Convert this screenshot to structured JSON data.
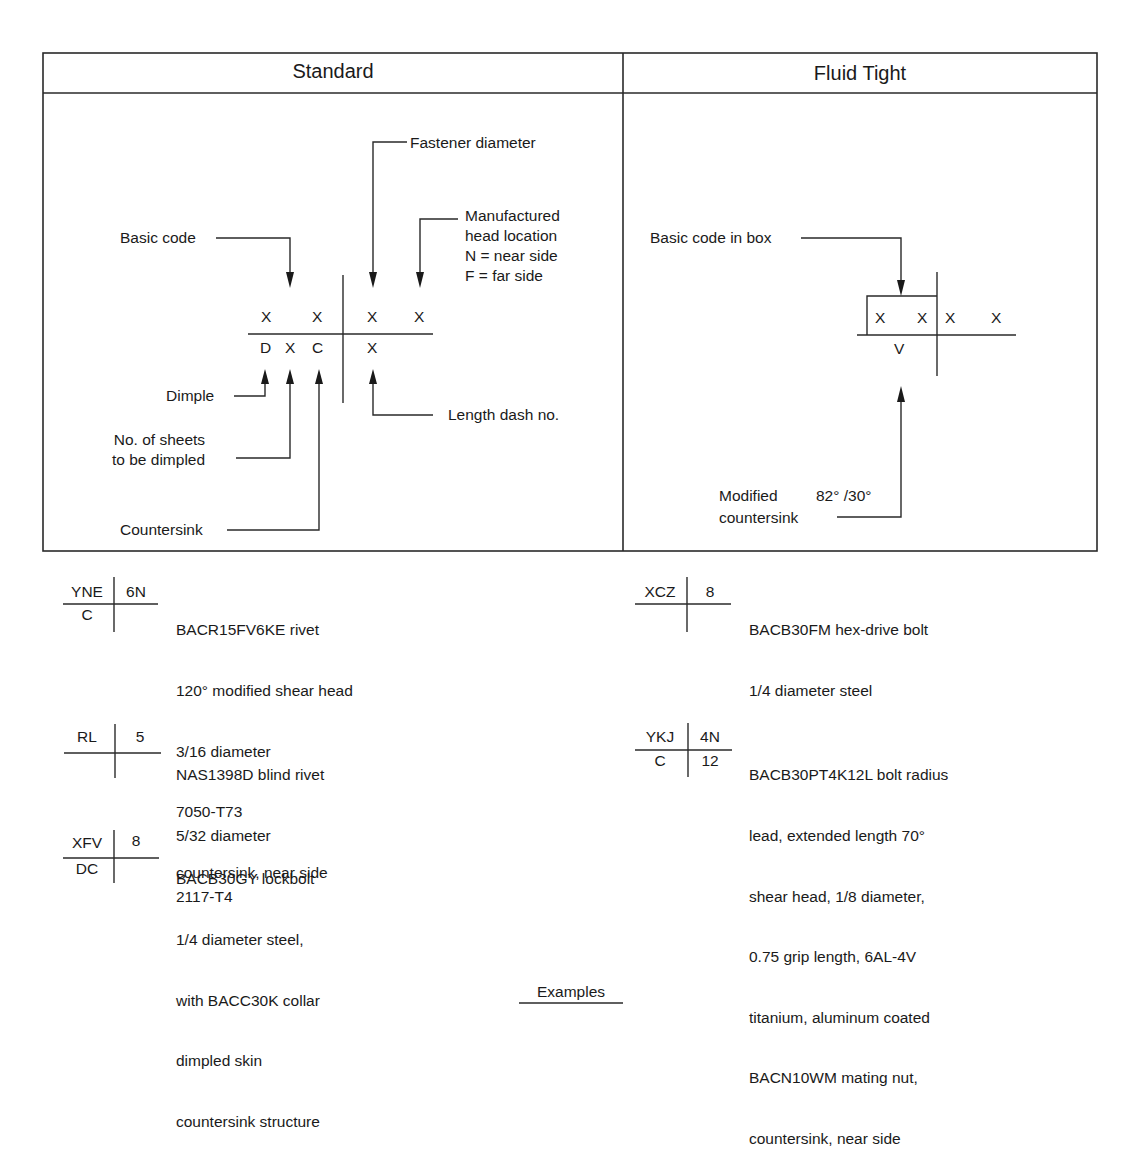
{
  "table": {
    "columns": [
      {
        "title": "Standard"
      },
      {
        "title": "Fluid Tight"
      }
    ]
  },
  "standard": {
    "labels": {
      "fastener_diameter": "Fastener diameter",
      "manufactured": [
        "Manufactured",
        "head location",
        "N = near side",
        "F = far side"
      ],
      "basic_code": "Basic code",
      "dimple": "Dimple",
      "sheets": [
        "No. of sheets",
        "to be dimpled"
      ],
      "countersink": "Countersink",
      "length_dash": "Length dash no."
    },
    "grid": {
      "top": [
        "X",
        "X",
        "X",
        "X"
      ],
      "bottom": [
        "D",
        "X",
        "C",
        "X"
      ]
    }
  },
  "fluid_tight": {
    "labels": {
      "basic_code_box": "Basic code in box",
      "modified": "Modified",
      "angle": "82° /30°",
      "countersink": "countersink"
    },
    "grid": {
      "top": [
        "X",
        "X",
        "X",
        "X"
      ],
      "bottom": [
        "V"
      ]
    }
  },
  "examples": {
    "left": [
      {
        "tl": "YNE",
        "tr": "6N",
        "bl": "C",
        "br": "",
        "desc": [
          "BACR15FV6KE rivet",
          "120° modified shear head",
          "3/16 diameter",
          "7050-T73",
          "countersink, near side"
        ]
      },
      {
        "tl": "RL",
        "tr": "5",
        "bl": "",
        "br": "",
        "desc": [
          "NAS1398D blind rivet",
          "5/32 diameter",
          "2117-T4"
        ]
      },
      {
        "tl": "XFV",
        "tr": "8",
        "bl": "DC",
        "br": "",
        "desc": [
          "BACB30GY lockbolt",
          "1/4 diameter steel,",
          "with BACC30K collar",
          "dimpled skin",
          "countersink structure"
        ]
      }
    ],
    "right": [
      {
        "tl": "XCZ",
        "tr": "8",
        "bl": "",
        "br": "",
        "desc": [
          "BACB30FM hex-drive bolt",
          "1/4 diameter steel"
        ]
      },
      {
        "tl": "YKJ",
        "tr": "4N",
        "bl": "C",
        "br": "12",
        "desc": [
          "BACB30PT4K12L bolt radius",
          "lead, extended length 70°",
          "shear head, 1/8 diameter,",
          "0.75 grip length, 6AL-4V",
          "titanium, aluminum coated",
          "BACN10WM mating nut,",
          "countersink, near side"
        ]
      }
    ]
  },
  "caption": "Examples"
}
